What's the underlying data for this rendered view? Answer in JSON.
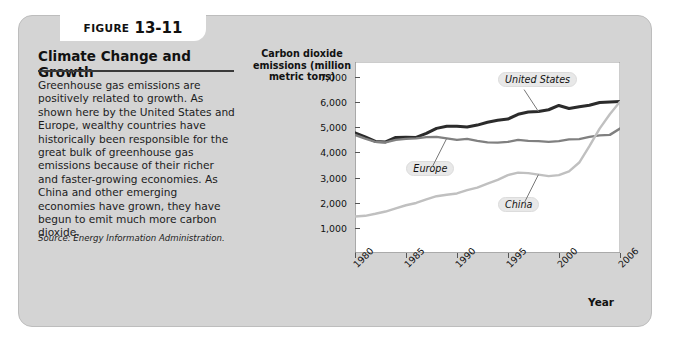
{
  "figure": {
    "tab_label": "FIGURE",
    "tab_number": "13-11",
    "headline": "Climate Change and Growth",
    "body": "Greenhouse gas emissions are positively related to growth. As shown here by the United States and Europe, wealthy countries have historically been responsible for the great bulk of greenhouse gas emissions because of their richer and faster-growing economies. As China and other emerging economies have grown, they have begun to emit much more carbon dioxide.",
    "source": "Source: Energy Information Administration."
  },
  "chart_data": {
    "type": "line",
    "title": "",
    "ylabel": "Carbon dioxide emissions (million metric tons)",
    "xlabel": "Year",
    "ylim": [
      0,
      7600
    ],
    "yticks": [
      1000,
      2000,
      3000,
      4000,
      5000,
      6000,
      7000
    ],
    "ytick_labels": [
      "1,000",
      "2,000",
      "3,000",
      "4,000",
      "5,000",
      "6,000",
      "7,000"
    ],
    "xlim": [
      1980,
      2006
    ],
    "xticks": [
      1980,
      1985,
      1990,
      1995,
      2000,
      2006
    ],
    "xtick_labels": [
      "1980",
      "1985",
      "1990",
      "1995",
      "2000",
      "2006"
    ],
    "grid": false,
    "legend_position": "inline-callouts",
    "x": [
      1980,
      1981,
      1982,
      1983,
      1984,
      1985,
      1986,
      1987,
      1988,
      1989,
      1990,
      1991,
      1992,
      1993,
      1994,
      1995,
      1996,
      1997,
      1998,
      1999,
      2000,
      2001,
      2002,
      2003,
      2004,
      2005,
      2006
    ],
    "series": [
      {
        "name": "United States",
        "color": "#2b2b2b",
        "values": [
          4780,
          4620,
          4440,
          4420,
          4600,
          4610,
          4600,
          4760,
          4960,
          5040,
          5040,
          5010,
          5090,
          5200,
          5280,
          5330,
          5520,
          5610,
          5630,
          5700,
          5870,
          5750,
          5820,
          5880,
          5990,
          6010,
          6030
        ]
      },
      {
        "name": "Europe",
        "color": "#808080",
        "values": [
          4700,
          4550,
          4420,
          4400,
          4500,
          4540,
          4560,
          4610,
          4620,
          4560,
          4500,
          4540,
          4460,
          4400,
          4390,
          4420,
          4500,
          4460,
          4450,
          4420,
          4450,
          4520,
          4530,
          4620,
          4680,
          4700,
          4950
        ]
      },
      {
        "name": "China",
        "color": "#c0c0c0",
        "values": [
          1450,
          1480,
          1560,
          1650,
          1780,
          1900,
          1990,
          2130,
          2260,
          2320,
          2370,
          2500,
          2600,
          2760,
          2910,
          3100,
          3200,
          3180,
          3120,
          3060,
          3100,
          3250,
          3600,
          4250,
          4950,
          5520,
          6020
        ]
      }
    ],
    "annotations": [
      {
        "label": "United States",
        "x": 1996,
        "y": 6900
      },
      {
        "label": "Europe",
        "x": 1987,
        "y": 3350
      },
      {
        "label": "China",
        "x": 1996,
        "y": 1900
      }
    ]
  }
}
